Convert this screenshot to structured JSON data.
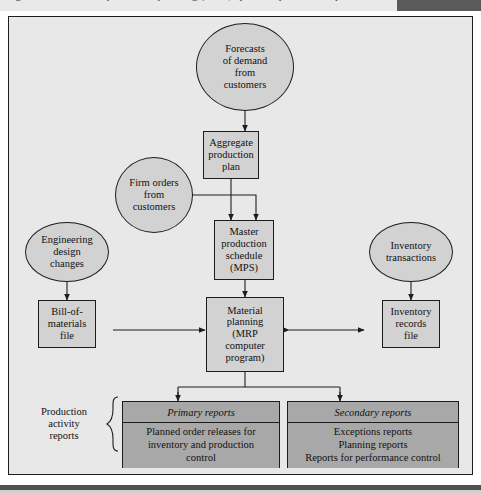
{
  "caption": {
    "top_strip_text": "Figure — Material requirements planning (MRP) system inputs and outputs"
  },
  "diagram": {
    "colors": {
      "panel_background": "#e8e8e8",
      "node_fill": "#d2d2d2",
      "report_fill": "#a8a8a8",
      "outline": "#1d1d1d"
    },
    "nodes": {
      "forecasts": {
        "shape": "ellipse",
        "label": "Forecasts\nof demand\nfrom\ncustomers"
      },
      "aggregate_plan": {
        "shape": "rect",
        "label": "Aggregate\nproduction\nplan"
      },
      "firm_orders": {
        "shape": "ellipse",
        "label": "Firm orders\nfrom\ncustomers"
      },
      "master_schedule": {
        "shape": "rect",
        "label": "Master\nproduction\nschedule\n(MPS)"
      },
      "engineering_changes": {
        "shape": "ellipse",
        "label": "Engineering\ndesign\nchanges"
      },
      "inventory_transactions": {
        "shape": "ellipse",
        "label": "Inventory\ntransactions"
      },
      "bom_file": {
        "shape": "rect",
        "label": "Bill-of-\nmaterials\nfile"
      },
      "material_planning": {
        "shape": "rect",
        "label": "Material\nplanning\n(MRP\ncomputer\nprogram)"
      },
      "inventory_records": {
        "shape": "rect",
        "label": "Inventory\nrecords\nfile"
      }
    },
    "reports": {
      "group_label": "Production\nactivity\nreports",
      "primary": {
        "header": "Primary reports",
        "body": "Planned order releases for\ninventory and production\ncontrol"
      },
      "secondary": {
        "header": "Secondary reports",
        "body": "Exceptions reports\nPlanning reports\nReports for performance control"
      }
    }
  }
}
